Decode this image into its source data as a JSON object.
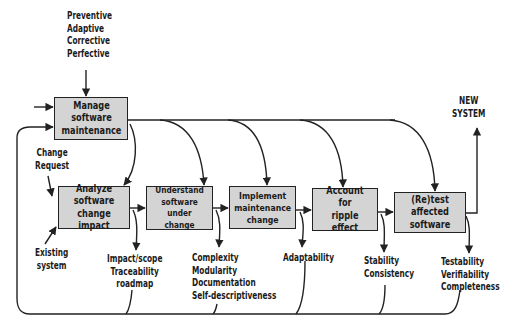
{
  "diagram": {
    "type_list": [
      "Preventive",
      "Adaptive",
      "Corrective",
      "Perfective"
    ],
    "boxes": [
      {
        "id": "manage",
        "label": "Manage software\nmaintenance"
      },
      {
        "id": "analyze",
        "label": "Analyze software\nchange impact"
      },
      {
        "id": "understand",
        "label": "Understand\nsoftware under\nchange"
      },
      {
        "id": "implement",
        "label": "Implement\nmaintenance\nchange"
      },
      {
        "id": "ripple",
        "label": "Account for\nripple effect"
      },
      {
        "id": "retest",
        "label": "(Re)test\naffected software"
      }
    ],
    "inputs": {
      "change_request": [
        "Change",
        "Request"
      ],
      "existing_system": [
        "Existing",
        "system"
      ]
    },
    "output": [
      "NEW",
      "SYSTEM"
    ],
    "attributes": {
      "analyze": [
        "Impact/scope",
        "Traceability",
        "roadmap"
      ],
      "understand": [
        "Complexity",
        "Modularity",
        "Documentation",
        "Self-descriptiveness"
      ],
      "implement": [
        "Adaptability"
      ],
      "ripple": [
        "Stability",
        "Consistency"
      ],
      "retest": [
        "Testability",
        "Verifiability",
        "Completeness"
      ]
    },
    "colors": {
      "box_fill": "#d4d4d4",
      "stroke": "#222222"
    }
  }
}
